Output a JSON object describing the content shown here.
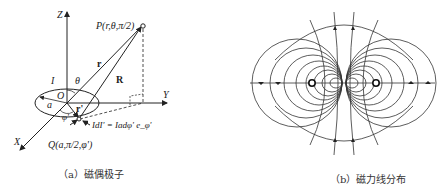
{
  "panel_a": {
    "caption": "（a）磁偶极子",
    "labels": {
      "z_axis": "Z",
      "y_axis": "Y",
      "x_axis": "X",
      "point_p": "P(r,θ,π/2)",
      "vector_r": "r",
      "vector_R": "R",
      "current": "I",
      "theta": "θ",
      "origin": "O",
      "radius": "a",
      "phi_prime": "φ'",
      "vector_r_prime": "r'",
      "current_element": "IdI' = Iadφ' e_φ'",
      "point_q": "Q(a,π/2,φ')"
    }
  },
  "panel_b": {
    "caption": "（b）磁力线分布"
  }
}
